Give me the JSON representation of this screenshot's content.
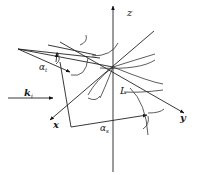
{
  "diagram": {
    "type": "3d-coordinate-scattering-geometry",
    "axes": {
      "z": {
        "label": "z"
      },
      "x": {
        "label": "x"
      },
      "y": {
        "label": "y"
      }
    },
    "labels": {
      "incident_vector": "k",
      "incident_vector_sub": "i",
      "alpha_t": "α",
      "alpha_t_sub": "t",
      "alpha_s": "α",
      "alpha_s_sub": "s",
      "length": "L"
    },
    "colors": {
      "stroke": "#222222",
      "background": "#ffffff"
    }
  }
}
